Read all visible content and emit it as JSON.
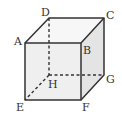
{
  "diagram": {
    "type": "cube",
    "colors": {
      "edge": "#333333",
      "face_front": "#f2f2f2",
      "face_top": "#f6f6f6",
      "face_side": "#e6e6e6"
    },
    "vertices": {
      "A": {
        "label": "A",
        "x": 25,
        "y": 43
      },
      "B": {
        "label": "B",
        "x": 81,
        "y": 43
      },
      "C": {
        "label": "C",
        "x": 104,
        "y": 18
      },
      "D": {
        "label": "D",
        "x": 49,
        "y": 18
      },
      "E": {
        "label": "E",
        "x": 25,
        "y": 100
      },
      "F": {
        "label": "F",
        "x": 81,
        "y": 100
      },
      "G": {
        "label": "G",
        "x": 104,
        "y": 75
      },
      "H": {
        "label": "H",
        "x": 49,
        "y": 75
      }
    },
    "hidden_edges": [
      "DH",
      "HG",
      "HE"
    ]
  }
}
